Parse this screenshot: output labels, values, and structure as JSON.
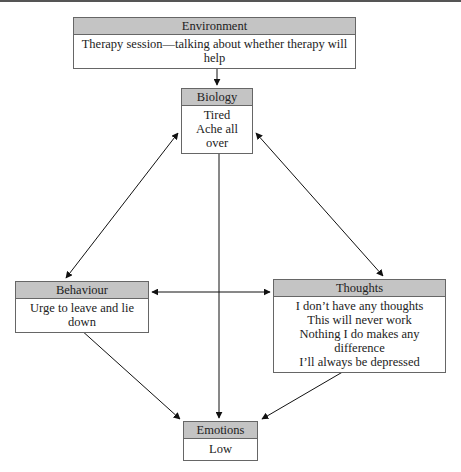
{
  "diagram": {
    "type": "cbt five-areas model",
    "nodes": {
      "environment": {
        "title": "Environment",
        "lines": [
          "Therapy session—talking about whether therapy will help"
        ]
      },
      "biology": {
        "title": "Biology",
        "lines": [
          "Tired",
          "Ache all over"
        ]
      },
      "behaviour": {
        "title": "Behaviour",
        "lines": [
          "Urge to leave and lie down"
        ]
      },
      "thoughts": {
        "title": "Thoughts",
        "lines": [
          "I don’t have any thoughts",
          "This will never work",
          "Nothing I do makes any difference",
          "I’ll always be depressed"
        ]
      },
      "emotions": {
        "title": "Emotions",
        "lines": [
          "Low"
        ]
      }
    },
    "edges": [
      {
        "from": "environment",
        "to": "biology",
        "direction": "both"
      },
      {
        "from": "biology",
        "to": "behaviour",
        "direction": "both"
      },
      {
        "from": "biology",
        "to": "thoughts",
        "direction": "both"
      },
      {
        "from": "biology",
        "to": "emotions",
        "direction": "both"
      },
      {
        "from": "behaviour",
        "to": "thoughts",
        "direction": "both"
      },
      {
        "from": "behaviour",
        "to": "emotions",
        "direction": "both"
      },
      {
        "from": "thoughts",
        "to": "emotions",
        "direction": "both"
      }
    ],
    "colors": {
      "header_fill": "#c4c4c4",
      "border": "#666666",
      "arrow": "#111111"
    }
  }
}
